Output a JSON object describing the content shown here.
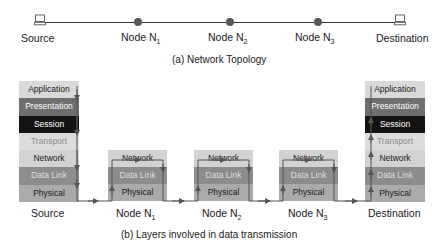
{
  "topology": {
    "caption": "(a)  Network Topology",
    "endpoints": {
      "source": {
        "label": "Source",
        "icon": "computer-icon"
      },
      "destination": {
        "label": "Destination",
        "icon": "computer-icon"
      }
    },
    "nodes": [
      {
        "label": "Node N",
        "sub": "1"
      },
      {
        "label": "Node N",
        "sub": "2"
      },
      {
        "label": "Node N",
        "sub": "3"
      }
    ]
  },
  "layers": {
    "caption": "(b)  Layers involved in data transmission",
    "full_stack": [
      "Application",
      "Presentation",
      "Session",
      "Transport",
      "Network",
      "Data Link",
      "Physical"
    ],
    "node_stack": [
      "Network",
      "Data Link",
      "Physical"
    ],
    "source_label": "Source",
    "destination_label": "Destination",
    "nodes": [
      {
        "label": "Node N",
        "sub": "1"
      },
      {
        "label": "Node N",
        "sub": "2"
      },
      {
        "label": "Node N",
        "sub": "3"
      }
    ]
  },
  "colors": {
    "application": "#d9d9d9",
    "presentation": "#6e6e6e",
    "session": "#141414",
    "transport": "#dcdcdc",
    "network": "#d2d2d2",
    "data_link": "#8c8c8c",
    "physical": "#aaaaaa",
    "node_dot": "#5a5a5a"
  }
}
